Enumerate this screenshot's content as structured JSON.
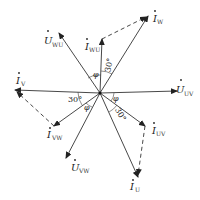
{
  "diagram": {
    "type": "phasor-diagram",
    "center": [
      100,
      93
    ],
    "vectors": [
      {
        "id": "U_UV",
        "symbol": "U",
        "subscript": "UV",
        "kind": "voltage",
        "end": [
          177,
          91
        ]
      },
      {
        "id": "U_WU",
        "symbol": "U",
        "subscript": "WU",
        "kind": "voltage",
        "end": [
          59,
          33
        ]
      },
      {
        "id": "U_VW",
        "symbol": "U",
        "subscript": "VW",
        "kind": "voltage",
        "end": [
          66,
          158
        ]
      },
      {
        "id": "I_W",
        "symbol": "I",
        "subscript": "W",
        "kind": "current",
        "end": [
          148,
          16
        ]
      },
      {
        "id": "I_WU",
        "symbol": "I",
        "subscript": "WU",
        "kind": "current",
        "end": [
          102,
          39
        ]
      },
      {
        "id": "I_V",
        "symbol": "I",
        "subscript": "V",
        "kind": "current",
        "end": [
          15,
          90
        ]
      },
      {
        "id": "I_VW",
        "symbol": "I",
        "subscript": "VW",
        "kind": "current",
        "end": [
          54,
          126
        ]
      },
      {
        "id": "I_UV",
        "symbol": "I",
        "subscript": "UV",
        "kind": "current",
        "end": [
          145,
          126
        ]
      },
      {
        "id": "I_U",
        "symbol": "I",
        "subscript": "U",
        "kind": "current",
        "end": [
          138,
          177
        ]
      }
    ],
    "dashed_links": [
      {
        "from": [
          102,
          39
        ],
        "to": [
          148,
          16
        ]
      },
      {
        "from": [
          54,
          126
        ],
        "to": [
          15,
          90
        ]
      },
      {
        "from": [
          145,
          126
        ],
        "to": [
          138,
          177
        ]
      }
    ],
    "angle_labels": [
      {
        "text": "30°",
        "position": "between I_WU and I_W"
      },
      {
        "text": "φ",
        "position": "between U_WU and I_WU"
      },
      {
        "text": "30°",
        "position": "between I_V and U_VW-side"
      },
      {
        "text": "φ",
        "position": "between I_VW and U_VW"
      },
      {
        "text": "φ",
        "position": "between U_UV and I_UV"
      },
      {
        "text": "30°",
        "position": "between I_UV and I_U"
      }
    ],
    "labels": {
      "u_uv": {
        "sym": "U",
        "sub": "UV"
      },
      "u_wu": {
        "sym": "U",
        "sub": "WU"
      },
      "u_vw": {
        "sym": "U",
        "sub": "VW"
      },
      "i_w": {
        "sym": "I",
        "sub": "W"
      },
      "i_wu": {
        "sym": "I",
        "sub": "WU"
      },
      "i_v": {
        "sym": "I",
        "sub": "V"
      },
      "i_vw": {
        "sym": "I",
        "sub": "VW"
      },
      "i_uv": {
        "sym": "I",
        "sub": "UV"
      },
      "i_u": {
        "sym": "I",
        "sub": "U"
      },
      "a30_top": "30°",
      "phi_top": "φ",
      "a30_left": "30°",
      "phi_left": "φ",
      "phi_right": "φ",
      "a30_bottom": "30°"
    }
  }
}
